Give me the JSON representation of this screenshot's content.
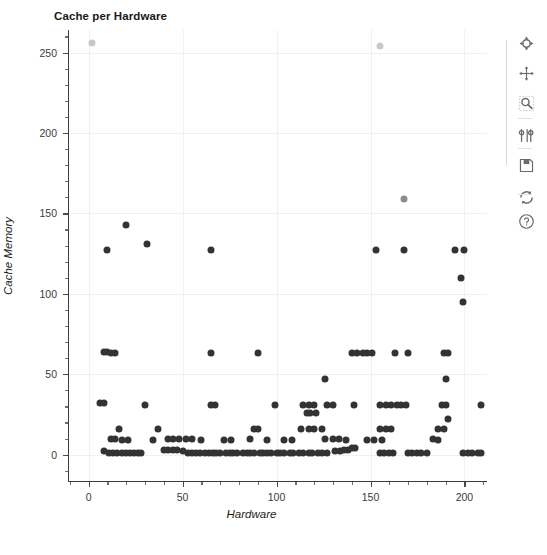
{
  "chart_data": {
    "type": "scatter",
    "title": "Cache per Hardware",
    "xlabel": "Hardware",
    "ylabel": "Cache Memory",
    "xlim": [
      -11,
      212
    ],
    "ylim": [
      -17,
      264
    ],
    "xticks": [
      0,
      50,
      100,
      150,
      200
    ],
    "yticks": [
      0,
      50,
      100,
      150,
      200,
      250
    ],
    "xtick_labels": [
      "0",
      "50",
      "100",
      "150",
      "200"
    ],
    "ytick_labels": [
      "0",
      "50",
      "100",
      "150",
      "200",
      "250"
    ],
    "x_minor_interval": 10,
    "y_minor_interval": 10,
    "grid": true,
    "grid_color": "#f0f0f0",
    "legend": null,
    "marker_size": 7,
    "series": [
      {
        "name": "Cache Memory",
        "color": "#333333",
        "points": [
          [
            2,
            256,
            "#c8c8c8"
          ],
          [
            155,
            254,
            "#c9c9c9"
          ],
          [
            168,
            159,
            "#8c8c8c"
          ],
          [
            20,
            143,
            "#333333"
          ],
          [
            31,
            131,
            "#333333"
          ],
          [
            10,
            127,
            "#333333"
          ],
          [
            65,
            127,
            "#333333"
          ],
          [
            153,
            127,
            "#333333"
          ],
          [
            168,
            127,
            "#333333"
          ],
          [
            195,
            127,
            "#333333"
          ],
          [
            200,
            127,
            "#333333"
          ],
          [
            198,
            110,
            "#333333"
          ],
          [
            199,
            95,
            "#333333"
          ],
          [
            8,
            64,
            "#333333"
          ],
          [
            10,
            64,
            "#333333"
          ],
          [
            12,
            63,
            "#333333"
          ],
          [
            14,
            63,
            "#333333"
          ],
          [
            65,
            63,
            "#333333"
          ],
          [
            90,
            63,
            "#333333"
          ],
          [
            140,
            63,
            "#333333"
          ],
          [
            143,
            63,
            "#333333"
          ],
          [
            146,
            63,
            "#333333"
          ],
          [
            148,
            63,
            "#333333"
          ],
          [
            151,
            63,
            "#333333"
          ],
          [
            163,
            63,
            "#333333"
          ],
          [
            170,
            63,
            "#333333"
          ],
          [
            189,
            63,
            "#333333"
          ],
          [
            191,
            63,
            "#333333"
          ],
          [
            126,
            47,
            "#333333"
          ],
          [
            190,
            47,
            "#333333"
          ],
          [
            6,
            32,
            "#333333"
          ],
          [
            8,
            32,
            "#333333"
          ],
          [
            30,
            31,
            "#333333"
          ],
          [
            65,
            31,
            "#333333"
          ],
          [
            67,
            31,
            "#333333"
          ],
          [
            99,
            31,
            "#333333"
          ],
          [
            114,
            31,
            "#333333"
          ],
          [
            117,
            31,
            "#333333"
          ],
          [
            120,
            31,
            "#333333"
          ],
          [
            127,
            31,
            "#333333"
          ],
          [
            130,
            31,
            "#333333"
          ],
          [
            141,
            31,
            "#333333"
          ],
          [
            155,
            31,
            "#333333"
          ],
          [
            158,
            31,
            "#333333"
          ],
          [
            161,
            31,
            "#333333"
          ],
          [
            164,
            31,
            "#333333"
          ],
          [
            166,
            31,
            "#333333"
          ],
          [
            169,
            31,
            "#333333"
          ],
          [
            188,
            31,
            "#333333"
          ],
          [
            190,
            31,
            "#333333"
          ],
          [
            209,
            31,
            "#333333"
          ],
          [
            116,
            26,
            "#333333"
          ],
          [
            118,
            26,
            "#333333"
          ],
          [
            121,
            26,
            "#333333"
          ],
          [
            191,
            22,
            "#333333"
          ],
          [
            16,
            16,
            "#333333"
          ],
          [
            37,
            16,
            "#333333"
          ],
          [
            88,
            16,
            "#333333"
          ],
          [
            90,
            16,
            "#333333"
          ],
          [
            113,
            16,
            "#333333"
          ],
          [
            117,
            16,
            "#333333"
          ],
          [
            120,
            16,
            "#333333"
          ],
          [
            124,
            16,
            "#333333"
          ],
          [
            155,
            16,
            "#333333"
          ],
          [
            158,
            16,
            "#333333"
          ],
          [
            161,
            16,
            "#333333"
          ],
          [
            186,
            16,
            "#333333"
          ],
          [
            189,
            16,
            "#333333"
          ],
          [
            12,
            10,
            "#333333"
          ],
          [
            14,
            10,
            "#333333"
          ],
          [
            18,
            9,
            "#333333"
          ],
          [
            21,
            9,
            "#333333"
          ],
          [
            34,
            9,
            "#333333"
          ],
          [
            42,
            10,
            "#333333"
          ],
          [
            45,
            10,
            "#333333"
          ],
          [
            48,
            10,
            "#333333"
          ],
          [
            52,
            10,
            "#333333"
          ],
          [
            55,
            10,
            "#333333"
          ],
          [
            60,
            9,
            "#333333"
          ],
          [
            72,
            9,
            "#333333"
          ],
          [
            76,
            9,
            "#333333"
          ],
          [
            86,
            10,
            "#333333"
          ],
          [
            95,
            9,
            "#333333"
          ],
          [
            104,
            9,
            "#333333"
          ],
          [
            108,
            9,
            "#333333"
          ],
          [
            126,
            10,
            "#333333"
          ],
          [
            130,
            10,
            "#333333"
          ],
          [
            133,
            10,
            "#333333"
          ],
          [
            137,
            9,
            "#333333"
          ],
          [
            148,
            9,
            "#333333"
          ],
          [
            152,
            9,
            "#333333"
          ],
          [
            156,
            9,
            "#333333"
          ],
          [
            183,
            10,
            "#333333"
          ],
          [
            186,
            9,
            "#333333"
          ],
          [
            8,
            2,
            "#333333"
          ],
          [
            11,
            1,
            "#333333"
          ],
          [
            13,
            1,
            "#333333"
          ],
          [
            15,
            1,
            "#333333"
          ],
          [
            18,
            1,
            "#333333"
          ],
          [
            20,
            1,
            "#333333"
          ],
          [
            22,
            1,
            "#333333"
          ],
          [
            24,
            1,
            "#333333"
          ],
          [
            26,
            1,
            "#333333"
          ],
          [
            28,
            1,
            "#333333"
          ],
          [
            40,
            3,
            "#333333"
          ],
          [
            42,
            3,
            "#333333"
          ],
          [
            45,
            3,
            "#333333"
          ],
          [
            47,
            3,
            "#333333"
          ],
          [
            50,
            2,
            "#333333"
          ],
          [
            53,
            1,
            "#333333"
          ],
          [
            55,
            1,
            "#333333"
          ],
          [
            57,
            1,
            "#333333"
          ],
          [
            59,
            1,
            "#333333"
          ],
          [
            62,
            1,
            "#333333"
          ],
          [
            64,
            1,
            "#333333"
          ],
          [
            66,
            1,
            "#333333"
          ],
          [
            68,
            1,
            "#333333"
          ],
          [
            70,
            1,
            "#333333"
          ],
          [
            73,
            1,
            "#333333"
          ],
          [
            75,
            1,
            "#333333"
          ],
          [
            77,
            1,
            "#333333"
          ],
          [
            79,
            1,
            "#333333"
          ],
          [
            82,
            1,
            "#333333"
          ],
          [
            84,
            1,
            "#333333"
          ],
          [
            86,
            1,
            "#333333"
          ],
          [
            88,
            1,
            "#333333"
          ],
          [
            91,
            1,
            "#333333"
          ],
          [
            93,
            1,
            "#333333"
          ],
          [
            95,
            1,
            "#333333"
          ],
          [
            97,
            1,
            "#333333"
          ],
          [
            100,
            1,
            "#333333"
          ],
          [
            102,
            1,
            "#333333"
          ],
          [
            104,
            1,
            "#333333"
          ],
          [
            107,
            1,
            "#333333"
          ],
          [
            109,
            1,
            "#333333"
          ],
          [
            112,
            1,
            "#333333"
          ],
          [
            114,
            1,
            "#333333"
          ],
          [
            117,
            1,
            "#333333"
          ],
          [
            119,
            1,
            "#333333"
          ],
          [
            122,
            1,
            "#333333"
          ],
          [
            124,
            1,
            "#333333"
          ],
          [
            127,
            1,
            "#333333"
          ],
          [
            131,
            2,
            "#333333"
          ],
          [
            134,
            2,
            "#333333"
          ],
          [
            136,
            3,
            "#333333"
          ],
          [
            138,
            3,
            "#333333"
          ],
          [
            140,
            4,
            "#333333"
          ],
          [
            142,
            4,
            "#333333"
          ],
          [
            155,
            1,
            "#333333"
          ],
          [
            157,
            1,
            "#333333"
          ],
          [
            160,
            1,
            "#333333"
          ],
          [
            162,
            1,
            "#333333"
          ],
          [
            170,
            1,
            "#333333"
          ],
          [
            172,
            1,
            "#333333"
          ],
          [
            175,
            1,
            "#333333"
          ],
          [
            177,
            1,
            "#333333"
          ],
          [
            180,
            1,
            "#333333"
          ],
          [
            199,
            1,
            "#333333"
          ],
          [
            202,
            1,
            "#333333"
          ],
          [
            204,
            1,
            "#333333"
          ],
          [
            207,
            1,
            "#333333"
          ],
          [
            209,
            1,
            "#333333"
          ]
        ]
      }
    ]
  },
  "toolbar": {
    "buttons": [
      {
        "name": "home-icon",
        "tooltip": "Home"
      },
      {
        "name": "pan-icon",
        "tooltip": "Pan"
      },
      {
        "name": "zoom-rect-icon",
        "tooltip": "Zoom to rectangle"
      },
      {
        "name": "subplot-config-icon",
        "tooltip": "Configure subplots"
      },
      {
        "name": "save-icon",
        "tooltip": "Save figure"
      },
      {
        "name": "refresh-icon",
        "tooltip": "Refresh"
      },
      {
        "name": "help-icon",
        "tooltip": "Help"
      }
    ]
  }
}
